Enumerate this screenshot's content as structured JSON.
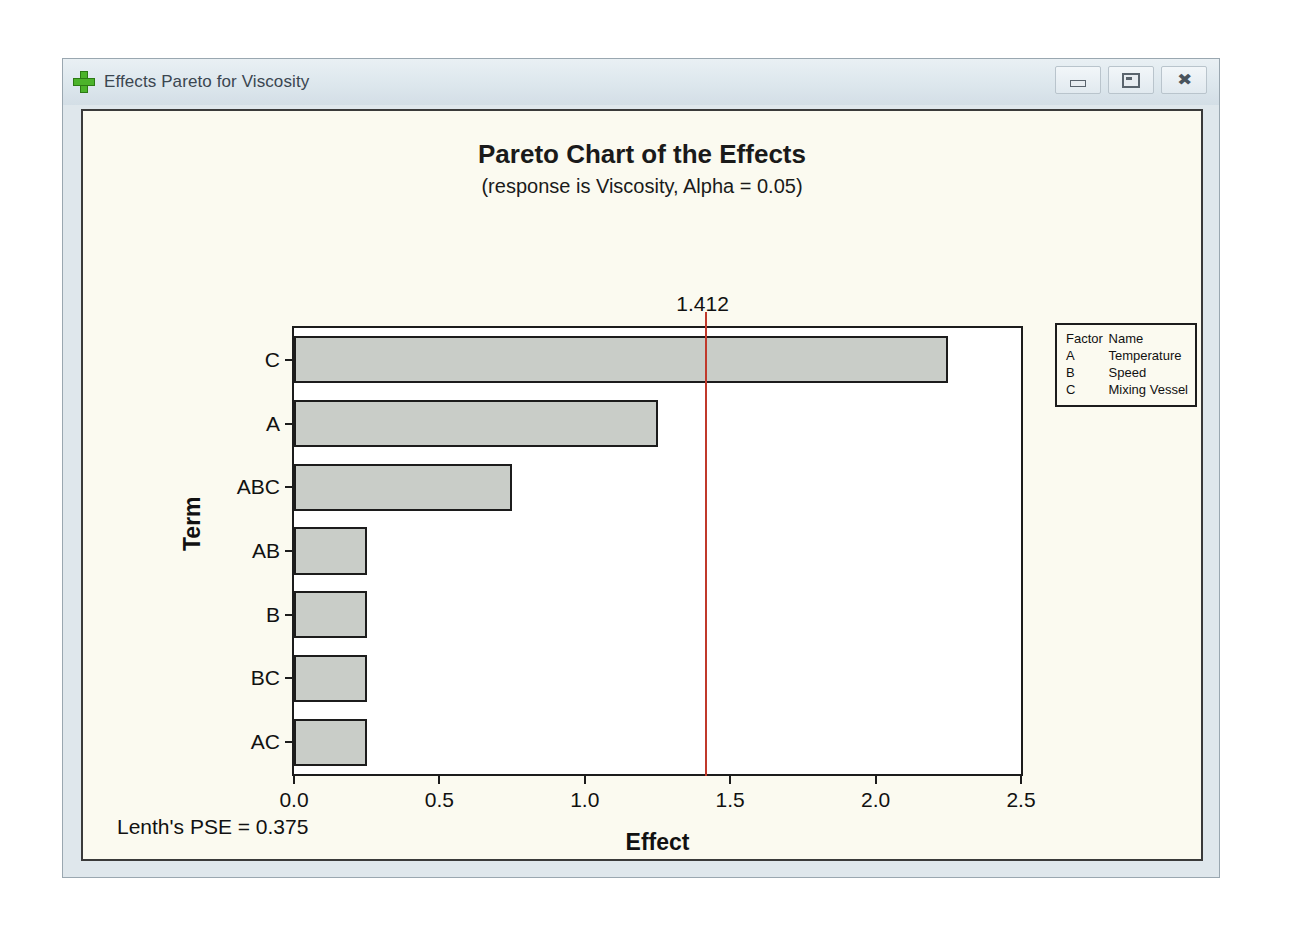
{
  "window": {
    "title": "Effects Pareto for Viscosity",
    "icon": "plus-icon",
    "controls": {
      "minimize": "minimize-icon",
      "restore": "restore-icon",
      "close": "✖"
    }
  },
  "chart_data": {
    "type": "bar",
    "orientation": "horizontal",
    "title": "Pareto Chart of the Effects",
    "subtitle": "(response is Viscosity, Alpha = 0.05)",
    "xlabel": "Effect",
    "ylabel": "Term",
    "categories": [
      "C",
      "A",
      "ABC",
      "AB",
      "B",
      "BC",
      "AC"
    ],
    "values": [
      2.25,
      1.25,
      0.75,
      0.25,
      0.25,
      0.25,
      0.25
    ],
    "xlim": [
      0.0,
      2.5
    ],
    "xticks": [
      "0.0",
      "0.5",
      "1.0",
      "1.5",
      "2.0",
      "2.5"
    ],
    "xtick_values": [
      0.0,
      0.5,
      1.0,
      1.5,
      2.0,
      2.5
    ],
    "grid": false,
    "bar_fill": "#c9cdc8",
    "bar_edge": "#1c1c1c",
    "reference_line": {
      "value": 1.412,
      "label": "1.412",
      "color": "#c0392b"
    },
    "legend": {
      "position": "right",
      "headers": [
        "Factor",
        "Name"
      ],
      "rows": [
        [
          "A",
          "Temperature"
        ],
        [
          "B",
          "Speed"
        ],
        [
          "C",
          "Mixing Vessel"
        ]
      ]
    },
    "footnote": "Lenth's PSE = 0.375"
  }
}
